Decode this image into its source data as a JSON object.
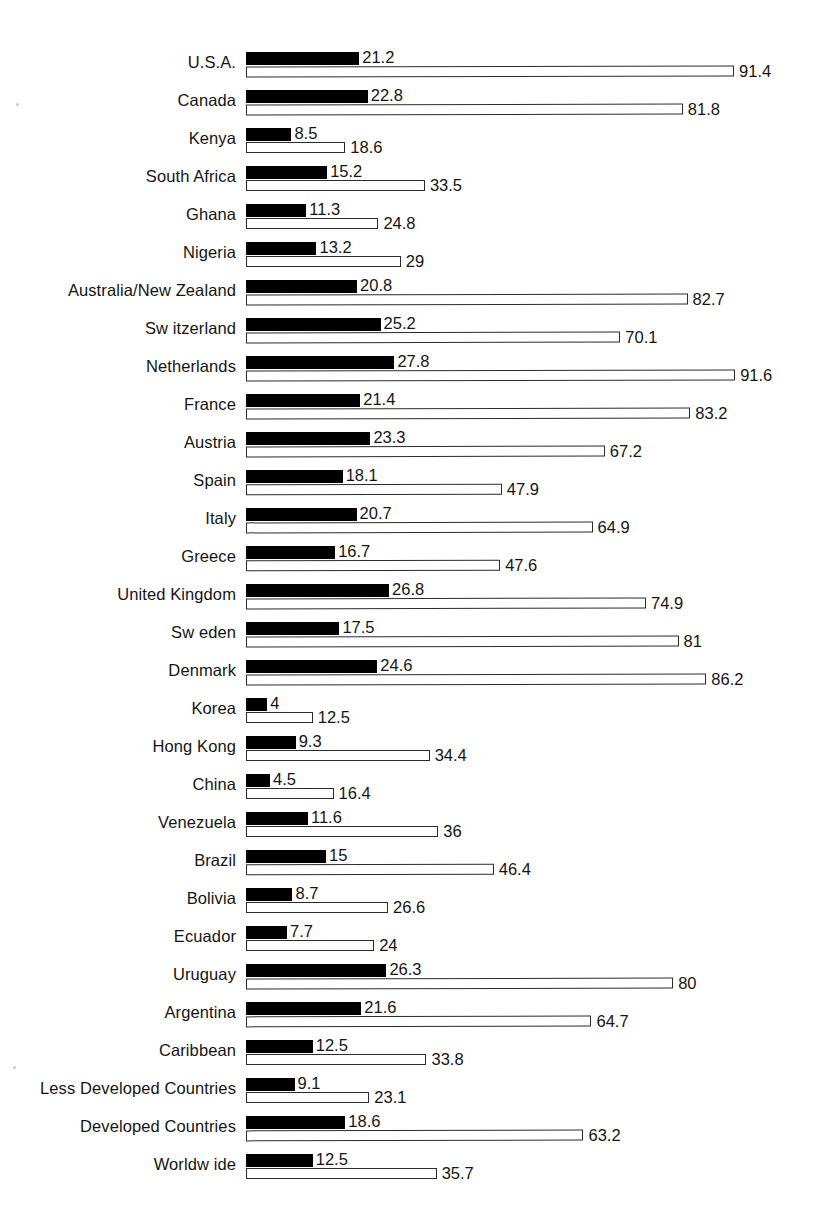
{
  "chart_data": {
    "type": "bar",
    "orientation": "horizontal",
    "grouped": true,
    "title": "",
    "subtitle": "",
    "xlabel": "",
    "ylabel": "",
    "grid": false,
    "legend_position": "none",
    "xlim": [
      0,
      95
    ],
    "axis_baseline_value": 0,
    "series": [
      {
        "name": "black-series",
        "style": "filled-black",
        "color": "#000000",
        "values": [
          21.2,
          22.8,
          8.5,
          15.2,
          11.3,
          13.2,
          20.8,
          25.2,
          27.8,
          21.4,
          23.3,
          18.1,
          20.7,
          16.7,
          26.8,
          17.5,
          24.6,
          4,
          9.3,
          4.5,
          11.6,
          15,
          8.7,
          7.7,
          26.3,
          21.6,
          12.5,
          9.1,
          18.6,
          12.5
        ]
      },
      {
        "name": "white-series",
        "style": "outlined-white",
        "color": "#ffffff",
        "border_color": "#2b2b2b",
        "values": [
          91.4,
          81.8,
          18.6,
          33.5,
          24.8,
          29,
          82.7,
          70.1,
          91.6,
          83.2,
          67.2,
          47.9,
          64.9,
          47.6,
          74.9,
          81,
          86.2,
          12.5,
          34.4,
          16.4,
          36,
          46.4,
          26.6,
          24,
          80,
          64.7,
          33.8,
          23.1,
          63.2,
          35.7
        ]
      }
    ],
    "categories": [
      "U.S.A.",
      "Canada",
      "Kenya",
      "South Africa",
      "Ghana",
      "Nigeria",
      "Australia/New  Zealand",
      "Sw itzerland",
      "Netherlands",
      "France",
      "Austria",
      "Spain",
      "Italy",
      "Greece",
      "United Kingdom",
      "Sw eden",
      "Denmark",
      "Korea",
      "Hong Kong",
      "China",
      "Venezuela",
      "Brazil",
      "Bolivia",
      "Ecuador",
      "Uruguay",
      "Argentina",
      "Caribbean",
      "Less Developed Countries",
      "Developed Countries",
      "Worldw ide"
    ],
    "rows": [
      {
        "label": "U.S.A.",
        "black": 21.2,
        "white": 91.4,
        "black_text": "21.2",
        "white_text": "91.4"
      },
      {
        "label": "Canada",
        "black": 22.8,
        "white": 81.8,
        "black_text": "22.8",
        "white_text": "81.8"
      },
      {
        "label": "Kenya",
        "black": 8.5,
        "white": 18.6,
        "black_text": "8.5",
        "white_text": "18.6"
      },
      {
        "label": "South Africa",
        "black": 15.2,
        "white": 33.5,
        "black_text": "15.2",
        "white_text": "33.5"
      },
      {
        "label": "Ghana",
        "black": 11.3,
        "white": 24.8,
        "black_text": "11.3",
        "white_text": "24.8"
      },
      {
        "label": "Nigeria",
        "black": 13.2,
        "white": 29,
        "black_text": "13.2",
        "white_text": "29"
      },
      {
        "label": "Australia/New  Zealand",
        "black": 20.8,
        "white": 82.7,
        "black_text": "20.8",
        "white_text": "82.7"
      },
      {
        "label": "Sw itzerland",
        "black": 25.2,
        "white": 70.1,
        "black_text": "25.2",
        "white_text": "70.1"
      },
      {
        "label": "Netherlands",
        "black": 27.8,
        "white": 91.6,
        "black_text": "27.8",
        "white_text": "91.6"
      },
      {
        "label": "France",
        "black": 21.4,
        "white": 83.2,
        "black_text": "21.4",
        "white_text": "83.2"
      },
      {
        "label": "Austria",
        "black": 23.3,
        "white": 67.2,
        "black_text": "23.3",
        "white_text": "67.2"
      },
      {
        "label": "Spain",
        "black": 18.1,
        "white": 47.9,
        "black_text": "18.1",
        "white_text": "47.9"
      },
      {
        "label": "Italy",
        "black": 20.7,
        "white": 64.9,
        "black_text": "20.7",
        "white_text": "64.9"
      },
      {
        "label": "Greece",
        "black": 16.7,
        "white": 47.6,
        "black_text": "16.7",
        "white_text": "47.6"
      },
      {
        "label": "United Kingdom",
        "black": 26.8,
        "white": 74.9,
        "black_text": "26.8",
        "white_text": "74.9"
      },
      {
        "label": "Sw eden",
        "black": 17.5,
        "white": 81,
        "black_text": "17.5",
        "white_text": "81"
      },
      {
        "label": "Denmark",
        "black": 24.6,
        "white": 86.2,
        "black_text": "24.6",
        "white_text": "86.2"
      },
      {
        "label": "Korea",
        "black": 4,
        "white": 12.5,
        "black_text": "4",
        "white_text": "12.5"
      },
      {
        "label": "Hong Kong",
        "black": 9.3,
        "white": 34.4,
        "black_text": "9.3",
        "white_text": "34.4"
      },
      {
        "label": "China",
        "black": 4.5,
        "white": 16.4,
        "black_text": "4.5",
        "white_text": "16.4"
      },
      {
        "label": "Venezuela",
        "black": 11.6,
        "white": 36,
        "black_text": "11.6",
        "white_text": "36"
      },
      {
        "label": "Brazil",
        "black": 15,
        "white": 46.4,
        "black_text": "15",
        "white_text": "46.4"
      },
      {
        "label": "Bolivia",
        "black": 8.7,
        "white": 26.6,
        "black_text": "8.7",
        "white_text": "26.6"
      },
      {
        "label": "Ecuador",
        "black": 7.7,
        "white": 24,
        "black_text": "7.7",
        "white_text": "24"
      },
      {
        "label": "Uruguay",
        "black": 26.3,
        "white": 80,
        "black_text": "26.3",
        "white_text": "80"
      },
      {
        "label": "Argentina",
        "black": 21.6,
        "white": 64.7,
        "black_text": "21.6",
        "white_text": "64.7"
      },
      {
        "label": "Caribbean",
        "black": 12.5,
        "white": 33.8,
        "black_text": "12.5",
        "white_text": "33.8"
      },
      {
        "label": "Less Developed Countries",
        "black": 9.1,
        "white": 23.1,
        "black_text": "9.1",
        "white_text": "23.1"
      },
      {
        "label": "Developed Countries",
        "black": 18.6,
        "white": 63.2,
        "black_text": "18.6",
        "white_text": "63.2"
      },
      {
        "label": "Worldw ide",
        "black": 12.5,
        "white": 35.7,
        "black_text": "12.5",
        "white_text": "35.7"
      }
    ]
  },
  "layout": {
    "px_per_unit": 5.34,
    "bars_left_px": 246,
    "first_row_top_px": 50,
    "row_pitch_px": 38
  },
  "colors": {
    "background": "#ffffff",
    "black_series": "#000000",
    "white_series_fill": "#ffffff",
    "white_series_border": "#2b2b2b",
    "text": "#141414"
  }
}
